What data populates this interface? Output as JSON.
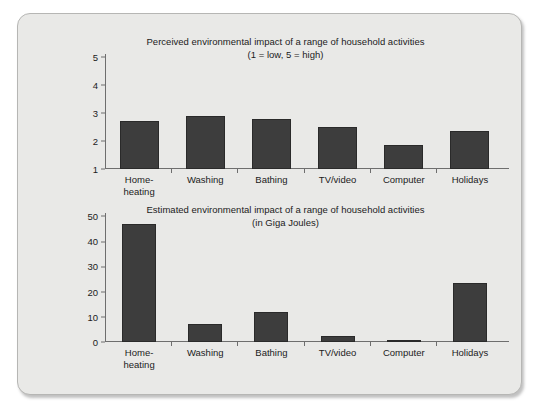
{
  "chart_data": [
    {
      "type": "bar",
      "id": "perceived",
      "title": "Perceived environmental impact of a range of household activities",
      "subtitle": "(1 = low, 5 = high)",
      "xlabel": "",
      "ylabel": "",
      "categories": [
        "Home-heating",
        "Washing",
        "Bathing",
        "TV/video",
        "Computer",
        "Holidays"
      ],
      "category_lines": [
        [
          "Home-",
          "heating"
        ],
        [
          "Washing",
          ""
        ],
        [
          "Bathing",
          ""
        ],
        [
          "TV/video",
          ""
        ],
        [
          "Computer",
          ""
        ],
        [
          "Holidays",
          ""
        ]
      ],
      "values": [
        2.7,
        2.9,
        2.8,
        2.5,
        1.85,
        2.35
      ],
      "ylim": [
        1,
        5
      ],
      "yticks": [
        "5",
        "4",
        "3",
        "2",
        "1"
      ],
      "ytick_values": [
        5,
        4,
        3,
        2,
        1
      ],
      "grid": false,
      "legend": "none",
      "bar_color": "#3d3d3d"
    },
    {
      "type": "bar",
      "id": "estimated",
      "title": "Estimated environmental impact of a range of household activities",
      "subtitle": "(in Giga Joules)",
      "xlabel": "",
      "ylabel": "",
      "categories": [
        "Home-heating",
        "Washing",
        "Bathing",
        "TV/video",
        "Computer",
        "Holidays"
      ],
      "category_lines": [
        [
          "Home-",
          "heating"
        ],
        [
          "Washing",
          ""
        ],
        [
          "Bathing",
          ""
        ],
        [
          "TV/video",
          ""
        ],
        [
          "Computer",
          ""
        ],
        [
          "Holidays",
          ""
        ]
      ],
      "values": [
        46.7,
        7.0,
        12.1,
        2.2,
        0.3,
        23.3
      ],
      "ylim": [
        0,
        50
      ],
      "yticks": [
        "50",
        "40",
        "30",
        "20",
        "10",
        "0"
      ],
      "ytick_values": [
        50,
        40,
        30,
        20,
        10,
        0
      ],
      "grid": false,
      "legend": "none",
      "bar_color": "#3d3d3d"
    }
  ],
  "colors": {
    "panel_background": "#e9e9e7",
    "panel_border": "#b6b6b4",
    "page_background": "#ffffff",
    "bar": "#3d3d3d",
    "axis": "#6e6e6e",
    "text": "#1b1b1b"
  }
}
